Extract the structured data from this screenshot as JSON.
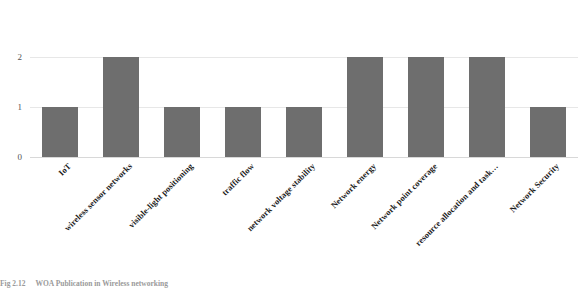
{
  "chart_data": {
    "type": "bar",
    "title": "",
    "subtitle": "",
    "xlabel": "",
    "ylabel": "",
    "ylim": [
      0,
      2.35
    ],
    "yticks": [
      "0",
      "1",
      "2"
    ],
    "ytick_values": [
      0,
      1,
      2
    ],
    "grid": true,
    "legend": false,
    "legend_position": "none",
    "orientation": "vertical",
    "bar_color": "#6e6e6e",
    "categories": [
      "IoT",
      "wireless sensor networks",
      "visible-light positioning",
      "traffic flow",
      "network voltage stability",
      "Network energy",
      "Network point coverage",
      "resource allocation and task…",
      "Network Security"
    ],
    "values": [
      1,
      2,
      1,
      1,
      1,
      2,
      2,
      2,
      1
    ]
  },
  "caption": {
    "number": "Fig 2.12",
    "text": "WOA Publication in Wireless networking"
  },
  "colors": {
    "bar": "#6e6e6e",
    "grid": "#e7e7e7",
    "axis_text": "#555555",
    "label_text": "#1b1b1b",
    "caption_text": "#9a9a9a",
    "background": "#ffffff"
  }
}
